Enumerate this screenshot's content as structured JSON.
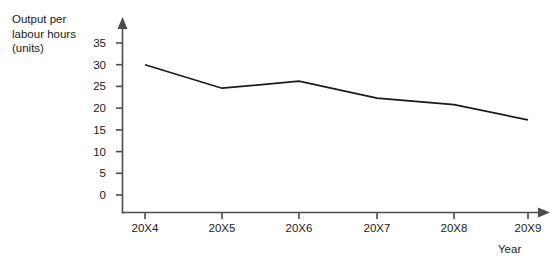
{
  "chart_data": {
    "type": "line",
    "title": "",
    "ylabel_lines": [
      "Output per",
      "labour hours",
      "(units)"
    ],
    "ylabel": "Output per labour hours (units)",
    "xlabel": "Year",
    "categories": [
      "20X4",
      "20X5",
      "20X6",
      "20X7",
      "20X8",
      "20X9"
    ],
    "values": [
      30.0,
      24.6,
      26.2,
      22.3,
      20.8,
      17.3
    ],
    "series": [
      {
        "name": "Output per labour hours (units)",
        "values": [
          30.0,
          24.6,
          26.2,
          22.3,
          20.8,
          17.3
        ]
      }
    ],
    "yticks": [
      0,
      5,
      10,
      15,
      20,
      25,
      30,
      35
    ],
    "ytick_labels": [
      "0",
      "5",
      "10",
      "15",
      "20",
      "25",
      "30",
      "35"
    ],
    "ylim": [
      0,
      37.5
    ],
    "xlim": [
      0,
      6
    ],
    "grid": false,
    "legend": false,
    "legend_position": "none",
    "line_color": "#1a1a1a",
    "axis_color": "#4d4d4d",
    "background_color": "#ffffff"
  }
}
